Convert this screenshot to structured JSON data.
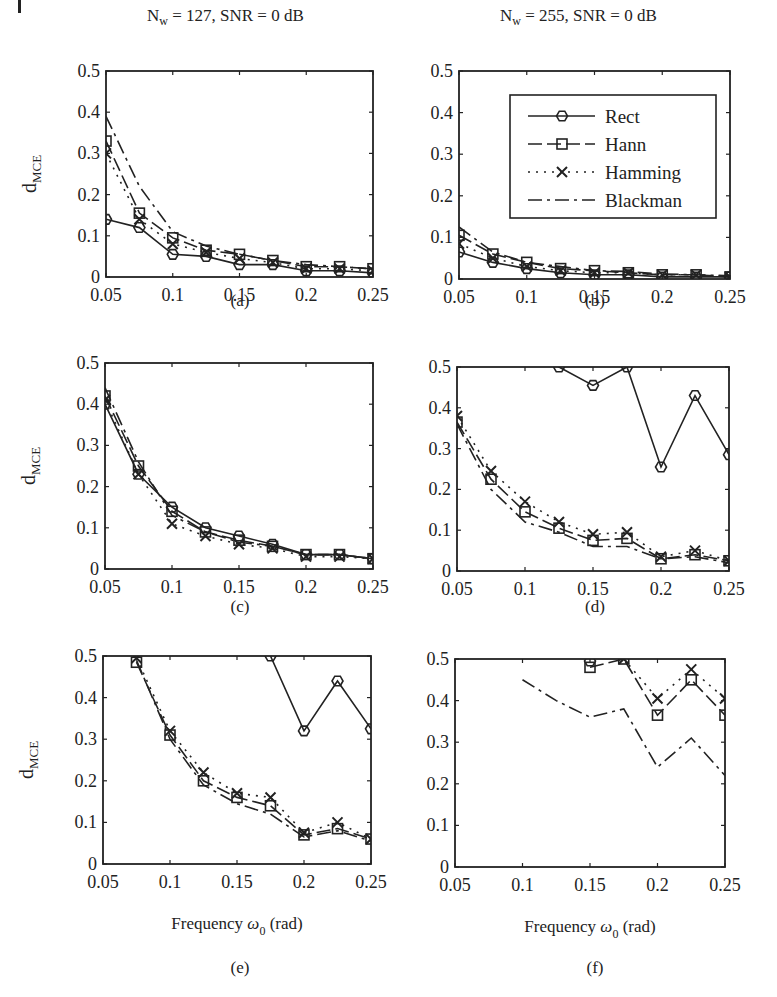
{
  "figure": {
    "column_titles": [
      {
        "main": "N",
        "sub": "w",
        "rest": " = 127,  SNR = 0 dB"
      },
      {
        "main": "N",
        "sub": "w",
        "rest": " = 255,  SNR = 0 dB"
      }
    ],
    "ylabel": {
      "main": "d",
      "sub": "MCE"
    },
    "xlabel": {
      "pre": "Frequency ",
      "sym": "ω",
      "sub": "0",
      "post": " (rad)"
    },
    "legend": [
      {
        "label": "Rect",
        "marker": "hexagon",
        "dash": ""
      },
      {
        "label": "Hann",
        "marker": "square",
        "dash": "14,5"
      },
      {
        "label": "Hamming",
        "marker": "x",
        "dash": "2,6"
      },
      {
        "label": "Blackman",
        "marker": "none",
        "dash": "14,5,3,5"
      }
    ],
    "captions": [
      "(a)",
      "(b)",
      "(c)",
      "(d)",
      "(e)",
      "(f)"
    ],
    "xticks": [
      "0.05",
      "0.1",
      "0.15",
      "0.2",
      "0.25"
    ],
    "yticks": [
      "0",
      "0.1",
      "0.2",
      "0.3",
      "0.4",
      "0.5"
    ]
  },
  "chart_data": [
    {
      "type": "line",
      "panel": "a",
      "title": "Nw = 127, SNR = 0 dB",
      "xlabel": "",
      "ylabel": "dMCE",
      "xlim": [
        0.05,
        0.25
      ],
      "ylim": [
        0,
        0.5
      ],
      "grid": false,
      "x": [
        0.05,
        0.075,
        0.1,
        0.125,
        0.15,
        0.175,
        0.2,
        0.225,
        0.25
      ],
      "series": [
        {
          "name": "Rect",
          "values": [
            0.14,
            0.12,
            0.055,
            0.05,
            0.03,
            0.03,
            0.015,
            0.015,
            0.01
          ]
        },
        {
          "name": "Hann",
          "values": [
            0.33,
            0.155,
            0.095,
            0.065,
            0.055,
            0.04,
            0.025,
            0.025,
            0.02
          ]
        },
        {
          "name": "Hamming",
          "values": [
            0.3,
            0.14,
            0.08,
            0.06,
            0.045,
            0.035,
            0.02,
            0.02,
            0.015
          ]
        },
        {
          "name": "Blackman",
          "values": [
            0.39,
            0.22,
            0.11,
            0.075,
            0.055,
            0.04,
            0.03,
            0.025,
            0.02
          ]
        }
      ]
    },
    {
      "type": "line",
      "panel": "b",
      "title": "Nw = 255, SNR = 0 dB",
      "xlim": [
        0.05,
        0.25
      ],
      "ylim": [
        0,
        0.5
      ],
      "grid": false,
      "legend_position": "upper right",
      "x": [
        0.05,
        0.075,
        0.1,
        0.125,
        0.15,
        0.175,
        0.2,
        0.225,
        0.25
      ],
      "series": [
        {
          "name": "Rect",
          "values": [
            0.065,
            0.04,
            0.025,
            0.015,
            0.01,
            0.01,
            0.005,
            0.005,
            0.005
          ]
        },
        {
          "name": "Hann",
          "values": [
            0.105,
            0.06,
            0.04,
            0.025,
            0.02,
            0.015,
            0.01,
            0.01,
            0.005
          ]
        },
        {
          "name": "Hamming",
          "values": [
            0.085,
            0.05,
            0.03,
            0.02,
            0.015,
            0.015,
            0.01,
            0.01,
            0.005
          ]
        },
        {
          "name": "Blackman",
          "values": [
            0.125,
            0.065,
            0.04,
            0.03,
            0.02,
            0.018,
            0.012,
            0.01,
            0.008
          ]
        }
      ]
    },
    {
      "type": "line",
      "panel": "c",
      "ylabel": "dMCE",
      "xlim": [
        0.05,
        0.25
      ],
      "ylim": [
        0,
        0.5
      ],
      "x": [
        0.05,
        0.075,
        0.1,
        0.125,
        0.15,
        0.175,
        0.2,
        0.225,
        0.25
      ],
      "series": [
        {
          "name": "Rect",
          "values": [
            0.4,
            0.23,
            0.15,
            0.1,
            0.08,
            0.06,
            0.035,
            0.035,
            0.025
          ]
        },
        {
          "name": "Hann",
          "values": [
            0.42,
            0.25,
            0.14,
            0.09,
            0.07,
            0.055,
            0.035,
            0.035,
            0.025
          ]
        },
        {
          "name": "Hamming",
          "values": [
            0.41,
            0.23,
            0.11,
            0.08,
            0.06,
            0.05,
            0.03,
            0.03,
            0.025
          ]
        },
        {
          "name": "Blackman",
          "values": [
            0.44,
            0.26,
            0.13,
            0.09,
            0.065,
            0.055,
            0.035,
            0.035,
            0.025
          ]
        }
      ]
    },
    {
      "type": "line",
      "panel": "d",
      "xlim": [
        0.05,
        0.25
      ],
      "ylim": [
        0,
        0.5
      ],
      "x": [
        0.05,
        0.075,
        0.1,
        0.125,
        0.15,
        0.175,
        0.2,
        0.225,
        0.25
      ],
      "series": [
        {
          "name": "Rect",
          "values": [
            null,
            null,
            0.55,
            0.5,
            0.455,
            0.5,
            0.255,
            0.43,
            0.285
          ]
        },
        {
          "name": "Hann",
          "values": [
            0.365,
            0.225,
            0.145,
            0.105,
            0.075,
            0.08,
            0.03,
            0.04,
            0.025
          ]
        },
        {
          "name": "Hamming",
          "values": [
            0.38,
            0.245,
            0.17,
            0.12,
            0.09,
            0.095,
            0.035,
            0.05,
            0.025
          ]
        },
        {
          "name": "Blackman",
          "values": [
            0.36,
            0.2,
            0.12,
            0.095,
            0.06,
            0.06,
            0.03,
            0.035,
            0.02
          ]
        }
      ]
    },
    {
      "type": "line",
      "panel": "e",
      "xlabel": "Frequency ω0 (rad)",
      "ylabel": "dMCE",
      "xlim": [
        0.05,
        0.25
      ],
      "ylim": [
        0,
        0.5
      ],
      "x": [
        0.075,
        0.1,
        0.125,
        0.15,
        0.175,
        0.2,
        0.225,
        0.25
      ],
      "series": [
        {
          "name": "Rect",
          "values": [
            null,
            null,
            null,
            null,
            0.5,
            0.32,
            0.44,
            0.325
          ]
        },
        {
          "name": "Hann",
          "values": [
            0.485,
            0.31,
            0.2,
            0.16,
            0.14,
            0.07,
            0.085,
            0.06
          ]
        },
        {
          "name": "Hamming",
          "values": [
            0.495,
            0.32,
            0.22,
            0.17,
            0.16,
            0.075,
            0.1,
            0.06
          ]
        },
        {
          "name": "Blackman",
          "values": [
            0.49,
            0.3,
            0.19,
            0.145,
            0.12,
            0.065,
            0.08,
            0.055
          ]
        }
      ]
    },
    {
      "type": "line",
      "panel": "f",
      "xlabel": "Frequency ω0 (rad)",
      "xlim": [
        0.05,
        0.25
      ],
      "ylim": [
        0,
        0.5
      ],
      "x": [
        0.1,
        0.125,
        0.15,
        0.175,
        0.2,
        0.225,
        0.25
      ],
      "series": [
        {
          "name": "Rect",
          "values": [
            null,
            null,
            0.495,
            null,
            null,
            null,
            null
          ]
        },
        {
          "name": "Hann",
          "values": [
            null,
            null,
            0.48,
            0.5,
            0.365,
            0.45,
            0.365
          ]
        },
        {
          "name": "Hamming",
          "values": [
            null,
            null,
            null,
            0.5,
            0.405,
            0.475,
            0.405
          ]
        },
        {
          "name": "Blackman",
          "values": [
            0.45,
            0.4,
            0.36,
            0.38,
            0.24,
            0.31,
            0.22
          ]
        }
      ]
    }
  ]
}
